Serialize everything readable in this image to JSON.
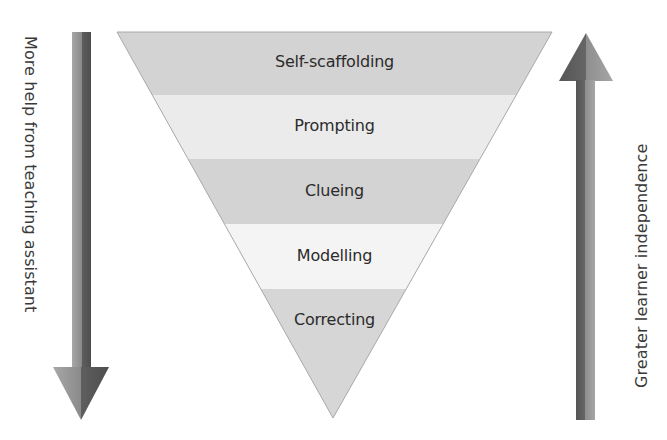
{
  "diagram": {
    "type": "inverted-triangle-hierarchy",
    "levels": [
      {
        "label": "Self-scaffolding",
        "fill": "#d3d3d3"
      },
      {
        "label": "Prompting",
        "fill": "#ececec"
      },
      {
        "label": "Clueing",
        "fill": "#d3d3d3"
      },
      {
        "label": "Modelling",
        "fill": "#f3f3f3"
      },
      {
        "label": "Correcting",
        "fill": "#d6d6d6"
      }
    ],
    "left_arrow": {
      "direction": "down",
      "label": "More help from teaching assistant"
    },
    "right_arrow": {
      "direction": "up",
      "label": "Greater learner independence"
    },
    "colors": {
      "arrow_dark": "#5a5a5a",
      "arrow_light": "#9a9a9a",
      "outline": "#a0a0a0",
      "text": "#2b2b2b"
    }
  }
}
